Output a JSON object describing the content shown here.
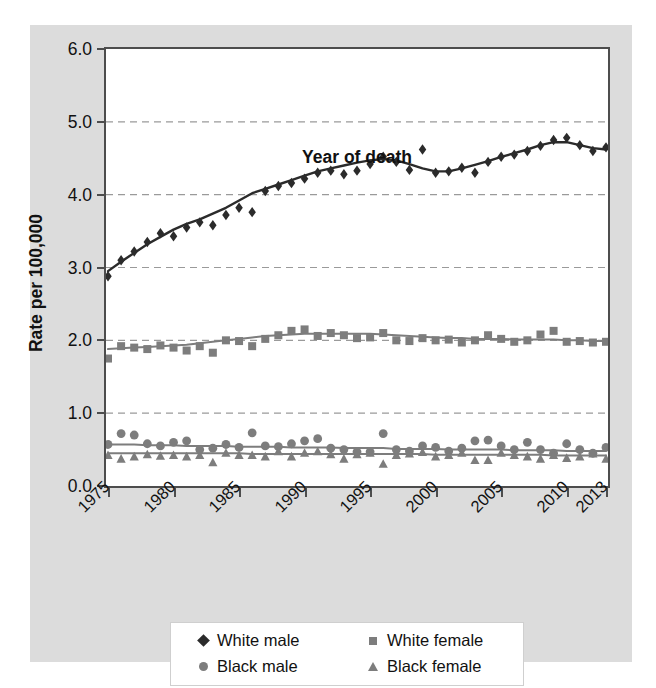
{
  "figure": {
    "background_color": "#dcdcdc",
    "plot_background_color": "#ffffff",
    "axis_color": "#4d4d4d",
    "grid_color": "#9a9a9a"
  },
  "chart_data": {
    "type": "scatter",
    "title": "",
    "xlabel": "Year of death",
    "ylabel": "Rate per 100,000",
    "xlim": [
      1975,
      2013
    ],
    "ylim": [
      0.0,
      6.0
    ],
    "ytick_labels": [
      "0.0",
      "1.0",
      "2.0",
      "3.0",
      "4.0",
      "5.0",
      "6.0"
    ],
    "ytick_values": [
      0.0,
      1.0,
      2.0,
      3.0,
      4.0,
      5.0,
      6.0
    ],
    "xtick_labels": [
      "1975",
      "1980",
      "1985",
      "1990",
      "1995",
      "2000",
      "2005",
      "2010",
      "2013"
    ],
    "xtick_values": [
      1975,
      1980,
      1985,
      1990,
      1995,
      2000,
      2005,
      2010,
      2013
    ],
    "grid": "horizontal-dashed",
    "legend_position": "bottom",
    "x": [
      1975,
      1976,
      1977,
      1978,
      1979,
      1980,
      1981,
      1982,
      1983,
      1984,
      1985,
      1986,
      1987,
      1988,
      1989,
      1990,
      1991,
      1992,
      1993,
      1994,
      1995,
      1996,
      1997,
      1998,
      1999,
      2000,
      2001,
      2002,
      2003,
      2004,
      2005,
      2006,
      2007,
      2008,
      2009,
      2010,
      2011,
      2012,
      2013
    ],
    "series": [
      {
        "name": "White male",
        "marker": "diamond",
        "color": "#2b2b2b",
        "values": [
          2.88,
          3.1,
          3.22,
          3.35,
          3.47,
          3.43,
          3.55,
          3.62,
          3.58,
          3.72,
          3.82,
          3.76,
          4.05,
          4.12,
          4.16,
          4.22,
          4.3,
          4.33,
          4.28,
          4.33,
          4.42,
          4.52,
          4.45,
          4.34,
          4.62,
          4.3,
          4.32,
          4.37,
          4.3,
          4.45,
          4.52,
          4.55,
          4.6,
          4.67,
          4.75,
          4.78,
          4.68,
          4.6,
          4.65
        ],
        "trend": [
          2.95,
          3.08,
          3.2,
          3.32,
          3.42,
          3.52,
          3.6,
          3.66,
          3.74,
          3.82,
          3.92,
          4.02,
          4.08,
          4.14,
          4.2,
          4.26,
          4.32,
          4.36,
          4.4,
          4.44,
          4.47,
          4.49,
          4.47,
          4.42,
          4.36,
          4.32,
          4.32,
          4.36,
          4.41,
          4.46,
          4.52,
          4.57,
          4.62,
          4.68,
          4.72,
          4.72,
          4.68,
          4.64,
          4.62
        ]
      },
      {
        "name": "White female",
        "marker": "square",
        "color": "#7d7d7d",
        "values": [
          1.75,
          1.92,
          1.9,
          1.88,
          1.93,
          1.9,
          1.86,
          1.92,
          1.83,
          2.0,
          1.99,
          1.92,
          2.02,
          2.07,
          2.13,
          2.15,
          2.06,
          2.1,
          2.07,
          2.03,
          2.04,
          2.1,
          2.0,
          1.99,
          2.03,
          2.0,
          2.01,
          1.97,
          2.0,
          2.07,
          2.02,
          1.98,
          2.0,
          2.08,
          2.13,
          1.98,
          1.99,
          1.97,
          1.98
        ],
        "trend": [
          1.88,
          1.89,
          1.9,
          1.91,
          1.92,
          1.93,
          1.94,
          1.96,
          1.98,
          2.0,
          2.02,
          2.04,
          2.06,
          2.07,
          2.08,
          2.09,
          2.09,
          2.09,
          2.09,
          2.09,
          2.09,
          2.08,
          2.07,
          2.06,
          2.05,
          2.04,
          2.03,
          2.03,
          2.02,
          2.02,
          2.02,
          2.01,
          2.01,
          2.01,
          2.01,
          2.0,
          2.0,
          1.99,
          1.99
        ]
      },
      {
        "name": "Black male",
        "marker": "circle",
        "color": "#7d7d7d",
        "values": [
          0.57,
          0.72,
          0.7,
          0.58,
          0.55,
          0.6,
          0.62,
          0.5,
          0.52,
          0.57,
          0.53,
          0.73,
          0.55,
          0.54,
          0.58,
          0.62,
          0.65,
          0.52,
          0.5,
          0.47,
          0.47,
          0.72,
          0.5,
          0.48,
          0.55,
          0.53,
          0.48,
          0.52,
          0.62,
          0.63,
          0.55,
          0.5,
          0.6,
          0.5,
          0.45,
          0.58,
          0.5,
          0.45,
          0.53
        ],
        "trend": [
          0.57,
          0.57,
          0.57,
          0.56,
          0.56,
          0.56,
          0.55,
          0.55,
          0.55,
          0.55,
          0.54,
          0.54,
          0.54,
          0.54,
          0.53,
          0.53,
          0.53,
          0.53,
          0.52,
          0.52,
          0.52,
          0.52,
          0.51,
          0.51,
          0.51,
          0.51,
          0.5,
          0.5,
          0.5,
          0.5,
          0.5,
          0.49,
          0.49,
          0.49,
          0.49,
          0.48,
          0.48,
          0.48,
          0.48
        ]
      },
      {
        "name": "Black female",
        "marker": "triangle",
        "color": "#7d7d7d",
        "values": [
          0.42,
          0.37,
          0.4,
          0.43,
          0.41,
          0.42,
          0.4,
          0.42,
          0.32,
          0.45,
          0.42,
          0.42,
          0.4,
          0.47,
          0.4,
          0.45,
          0.47,
          0.43,
          0.37,
          0.43,
          0.45,
          0.3,
          0.42,
          0.44,
          0.46,
          0.4,
          0.42,
          0.45,
          0.35,
          0.35,
          0.45,
          0.42,
          0.4,
          0.37,
          0.42,
          0.38,
          0.4,
          0.44,
          0.37
        ],
        "trend": [
          0.45,
          0.45,
          0.45,
          0.45,
          0.45,
          0.45,
          0.45,
          0.45,
          0.45,
          0.45,
          0.45,
          0.44,
          0.44,
          0.44,
          0.44,
          0.44,
          0.44,
          0.44,
          0.44,
          0.44,
          0.44,
          0.44,
          0.44,
          0.44,
          0.44,
          0.43,
          0.43,
          0.43,
          0.43,
          0.43,
          0.43,
          0.43,
          0.43,
          0.43,
          0.42,
          0.42,
          0.42,
          0.42,
          0.42
        ]
      }
    ]
  },
  "legend": {
    "entries": [
      {
        "label": "White male",
        "marker": "diamond",
        "color": "#2b2b2b"
      },
      {
        "label": "White female",
        "marker": "square",
        "color": "#7d7d7d"
      },
      {
        "label": "Black male",
        "marker": "circle",
        "color": "#7d7d7d"
      },
      {
        "label": "Black female",
        "marker": "triangle",
        "color": "#7d7d7d"
      }
    ]
  }
}
